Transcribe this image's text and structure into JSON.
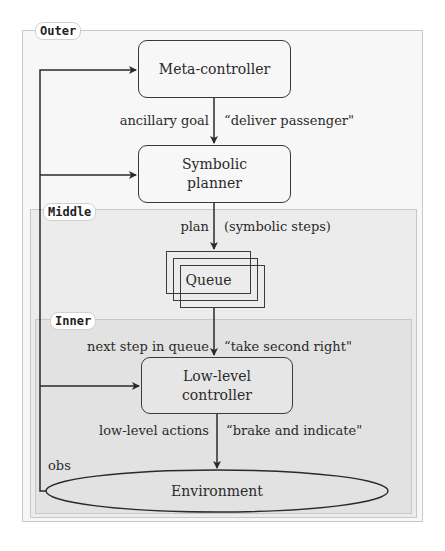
{
  "regions": {
    "outer": {
      "label": "Outer"
    },
    "middle": {
      "label": "Middle"
    },
    "inner": {
      "label": "Inner"
    }
  },
  "nodes": {
    "meta_controller": {
      "label": "Meta-controller"
    },
    "symbolic_planner": {
      "line1": "Symbolic",
      "line2": "planner"
    },
    "queue": {
      "label": "Queue"
    },
    "low_level_controller": {
      "line1": "Low-level",
      "line2": "controller"
    },
    "environment": {
      "label": "Environment"
    }
  },
  "edges": {
    "meta_to_planner": {
      "left_label": "ancillary goal",
      "right_label": "“deliver passenger\""
    },
    "planner_to_queue": {
      "left_label": "plan",
      "right_label": "(symbolic steps)"
    },
    "queue_to_lowlevel": {
      "left_label": "next step in queue",
      "right_label": "“take second right\""
    },
    "lowlevel_to_env": {
      "left_label": "low-level actions",
      "right_label": "“brake and indicate\""
    },
    "feedback": {
      "label": "obs"
    }
  },
  "colors": {
    "outer_bg": "#f7f7f7",
    "middle_bg": "#ececec",
    "inner_bg": "#e2e2e2",
    "stroke": "#2a2a2a"
  }
}
